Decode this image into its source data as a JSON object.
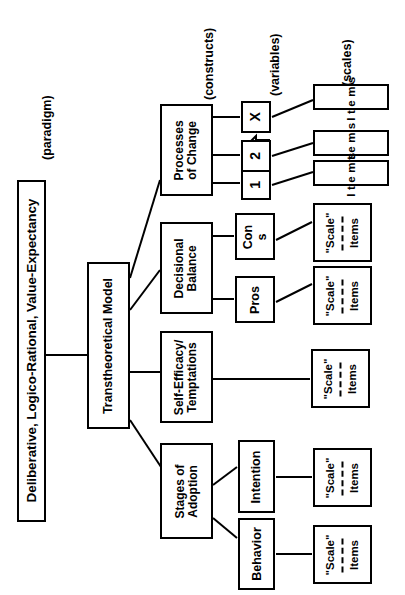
{
  "diagram": {
    "orientation": "rotated-90-ccw",
    "column_captions": [
      {
        "id": "paradigm",
        "text": "(paradigm)"
      },
      {
        "id": "constructs",
        "text": "(constructs)"
      },
      {
        "id": "variables",
        "text": "(variables)"
      },
      {
        "id": "scales",
        "text": "(scales)"
      }
    ],
    "paradigm": {
      "label": "Deliberative, Logico-Rational, Value-Expectancy"
    },
    "model": {
      "label": "Transtheoretical Model"
    },
    "constructs": [
      {
        "id": "processes-of-change",
        "label": "Processes\nof Change"
      },
      {
        "id": "decisional-balance",
        "label": "Decisional\nBalance"
      },
      {
        "id": "self-efficacy",
        "label": "Self-Efficacy/\nTemptations"
      },
      {
        "id": "stages-of-adoption",
        "label": "Stages of\nAdoption"
      }
    ],
    "variables": [
      {
        "id": "poc-x",
        "label": "X"
      },
      {
        "id": "poc-2",
        "label": "2"
      },
      {
        "id": "poc-1",
        "label": "1"
      },
      {
        "id": "db-cons",
        "label": "Con\ns"
      },
      {
        "id": "db-pros",
        "label": "Pros"
      },
      {
        "id": "soa-intention",
        "label": "Intention"
      },
      {
        "id": "soa-behavior",
        "label": "Behavior"
      }
    ],
    "scales": [
      {
        "id": "scale-poc-x",
        "kind": "items",
        "text": "Items"
      },
      {
        "id": "scale-poc-2",
        "kind": "items",
        "text": "Items"
      },
      {
        "id": "scale-poc-1",
        "kind": "items",
        "text": "Items"
      },
      {
        "id": "scale-cons",
        "kind": "scale",
        "title": "\"Scale\"",
        "items": "Items"
      },
      {
        "id": "scale-pros",
        "kind": "scale",
        "title": "\"Scale\"",
        "items": "Items"
      },
      {
        "id": "scale-se",
        "kind": "scale",
        "title": "\"Scale\"",
        "items": "Items"
      },
      {
        "id": "scale-int",
        "kind": "scale",
        "title": "\"Scale\"",
        "items": "Items"
      },
      {
        "id": "scale-beh",
        "kind": "scale",
        "title": "\"Scale\"",
        "items": "Items"
      }
    ],
    "ellipsis_arrow": {
      "id": "continuation-arrow",
      "meaning": "continues (more processes of change)"
    },
    "colors": {
      "stroke": "#000000",
      "background": "#ffffff"
    }
  }
}
